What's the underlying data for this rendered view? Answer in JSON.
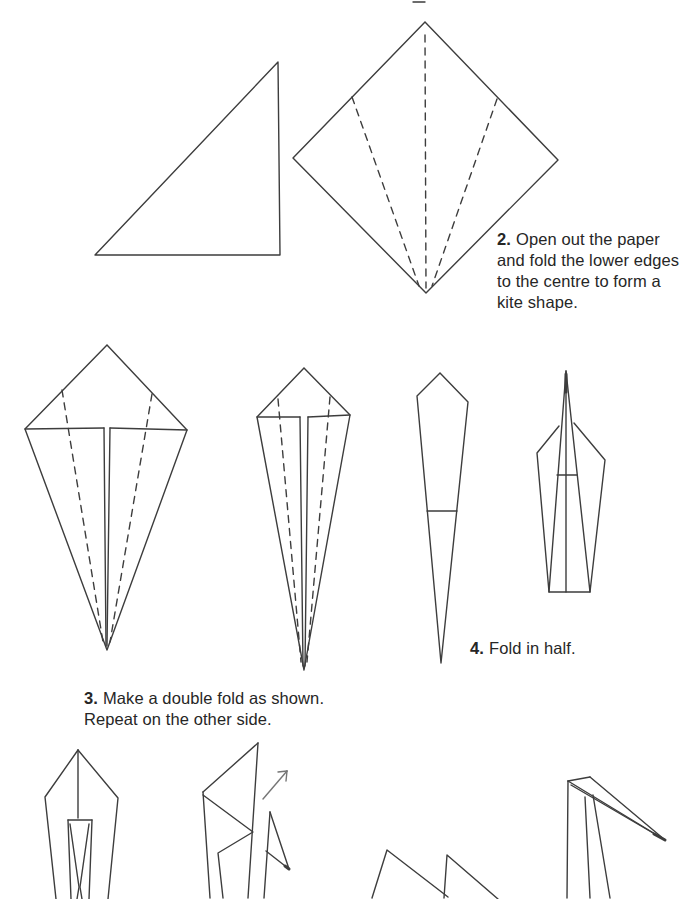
{
  "page": {
    "background": "#ffffff",
    "line_color": "#3d3d3d",
    "arrow_color": "#757575",
    "text_color": "#262626"
  },
  "instructions": [
    {
      "id": "step2",
      "number": "2.",
      "lines": [
        "Open out the paper",
        "and fold the lower edges",
        "to the centre to form a",
        "kite shape."
      ]
    },
    {
      "id": "step3",
      "number": "3.",
      "lines": [
        "Make a double fold as shown.",
        "Repeat on the other side."
      ]
    },
    {
      "id": "step4",
      "number": "4.",
      "lines": [
        "Fold in half."
      ]
    }
  ],
  "figures": [
    {
      "name": "step1-folded-triangle-figure",
      "solid": [
        [
          [
            95,
            255
          ],
          [
            278,
            62
          ],
          [
            280,
            255
          ],
          [
            95,
            255
          ]
        ]
      ]
    },
    {
      "name": "step2-open-square-figure",
      "solid": [
        [
          [
            413,
            2
          ],
          [
            425,
            2
          ]
        ],
        [
          [
            425,
            22
          ],
          [
            558,
            160
          ],
          [
            426,
            293
          ],
          [
            293,
            158
          ],
          [
            425,
            22
          ]
        ]
      ],
      "dashed": [
        [
          [
            425,
            35
          ],
          [
            426,
            288
          ]
        ],
        [
          [
            352,
            97
          ],
          [
            419,
            286
          ]
        ],
        [
          [
            497,
            99
          ],
          [
            432,
            286
          ]
        ]
      ]
    },
    {
      "name": "step3-kite-shape-figure",
      "solid": [
        [
          [
            107,
            345
          ],
          [
            187,
            430
          ],
          [
            107,
            650
          ],
          [
            25,
            429
          ],
          [
            107,
            345
          ]
        ],
        [
          [
            25,
            429
          ],
          [
            104,
            428
          ]
        ],
        [
          [
            110,
            428
          ],
          [
            187,
            430
          ]
        ],
        [
          [
            104,
            428
          ],
          [
            106,
            646
          ]
        ],
        [
          [
            110,
            428
          ],
          [
            107,
            646
          ]
        ]
      ],
      "dashed": [
        [
          [
            62,
            390
          ],
          [
            103,
            642
          ]
        ],
        [
          [
            152,
            394
          ],
          [
            110,
            642
          ]
        ]
      ]
    },
    {
      "name": "step3-double-fold-figure",
      "solid": [
        [
          [
            304,
            368
          ],
          [
            350,
            415
          ],
          [
            304,
            670
          ],
          [
            257,
            417
          ],
          [
            304,
            368
          ]
        ],
        [
          [
            257,
            417
          ],
          [
            300,
            417
          ]
        ],
        [
          [
            308,
            417
          ],
          [
            350,
            415
          ]
        ],
        [
          [
            300,
            417
          ],
          [
            303,
            666
          ]
        ],
        [
          [
            308,
            417
          ],
          [
            305,
            666
          ]
        ]
      ],
      "dashed": [
        [
          [
            278,
            399
          ],
          [
            301,
            662
          ]
        ],
        [
          [
            330,
            397
          ],
          [
            307,
            662
          ]
        ]
      ]
    },
    {
      "name": "step4-narrow-kite-figure",
      "solid": [
        [
          [
            440,
            373
          ],
          [
            468,
            402
          ],
          [
            441,
            663
          ],
          [
            417,
            396
          ],
          [
            440,
            373
          ]
        ],
        [
          [
            427,
            511
          ],
          [
            457,
            511
          ]
        ]
      ]
    },
    {
      "name": "step4-folded-in-half-figure",
      "solid": [
        [
          [
            559,
            426
          ],
          [
            537,
            453
          ],
          [
            549,
            592
          ],
          [
            590,
            592
          ],
          [
            605,
            460
          ],
          [
            574,
            423
          ]
        ],
        [
          [
            566,
            371
          ],
          [
            549,
            592
          ]
        ],
        [
          [
            566,
            371
          ],
          [
            590,
            592
          ]
        ],
        [
          [
            566,
            373
          ],
          [
            566,
            592
          ]
        ],
        [
          [
            557,
            475
          ],
          [
            577,
            475
          ]
        ]
      ],
      "thick": [
        [
          [
            566,
            374
          ],
          [
            566,
            392
          ]
        ]
      ]
    },
    {
      "name": "step5-double-fold-result-figure",
      "solid": [
        [
          [
            78,
            750
          ],
          [
            45,
            797
          ],
          [
            56,
            899
          ]
        ],
        [
          [
            78,
            750
          ],
          [
            118,
            798
          ],
          [
            108,
            899
          ]
        ],
        [
          [
            78,
            750
          ],
          [
            78,
            818
          ]
        ],
        [
          [
            68,
            820
          ],
          [
            92,
            820
          ]
        ],
        [
          [
            68,
            820
          ],
          [
            71,
            899
          ]
        ],
        [
          [
            92,
            820
          ],
          [
            89,
            899
          ]
        ],
        [
          [
            70,
            824
          ],
          [
            79,
            887
          ],
          [
            77,
            899
          ]
        ],
        [
          [
            89,
            824
          ],
          [
            80,
            887
          ],
          [
            82,
            899
          ]
        ]
      ]
    },
    {
      "name": "step5-reverse-fold-figure",
      "solid": [
        [
          [
            258,
            743
          ],
          [
            203,
            792
          ]
        ],
        [
          [
            203,
            792
          ],
          [
            210,
            898
          ]
        ],
        [
          [
            258,
            743
          ],
          [
            248,
            898
          ]
        ],
        [
          [
            203,
            795
          ],
          [
            253,
            832
          ],
          [
            218,
            853
          ],
          [
            223,
            898
          ]
        ],
        [
          [
            270,
            812
          ],
          [
            264,
            898
          ]
        ],
        [
          [
            270,
            812
          ],
          [
            289,
            869
          ],
          [
            266,
            851
          ]
        ]
      ],
      "thick": [
        [
          [
            285,
            866
          ],
          [
            289,
            869
          ]
        ]
      ]
    },
    {
      "name": "fold-direction-arrow",
      "color": "#757575",
      "solid": [
        [
          [
            263,
            799
          ],
          [
            287,
            771
          ]
        ],
        [
          [
            287,
            771
          ],
          [
            278,
            772
          ]
        ],
        [
          [
            287,
            771
          ],
          [
            286,
            781
          ]
        ]
      ]
    },
    {
      "name": "step6-zigzag-neck-figure",
      "solid": [
        [
          [
            372,
            898
          ],
          [
            387,
            850
          ],
          [
            448,
            897
          ]
        ],
        [
          [
            444,
            898
          ],
          [
            447,
            855
          ],
          [
            498,
            899
          ]
        ]
      ]
    },
    {
      "name": "step6-head-beak-figure",
      "solid": [
        [
          [
            568,
            781
          ],
          [
            567,
            898
          ]
        ],
        [
          [
            568,
            781
          ],
          [
            590,
            777
          ]
        ],
        [
          [
            568,
            781
          ],
          [
            665,
            840
          ]
        ],
        [
          [
            590,
            777
          ],
          [
            665,
            840
          ]
        ],
        [
          [
            571,
            785
          ],
          [
            665,
            840
          ]
        ],
        [
          [
            585,
            797
          ],
          [
            590,
            898
          ]
        ],
        [
          [
            593,
            795
          ],
          [
            610,
            898
          ]
        ]
      ],
      "thick": [
        [
          [
            654,
            834
          ],
          [
            665,
            840
          ]
        ]
      ]
    }
  ]
}
